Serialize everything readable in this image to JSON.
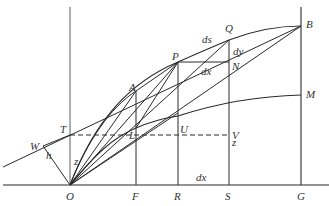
{
  "diagram": {
    "points": {
      "O": {
        "label": "O",
        "x": 70,
        "y": 185
      },
      "F": {
        "label": "F",
        "x": 136,
        "y": 185
      },
      "R": {
        "label": "R",
        "x": 178,
        "y": 185
      },
      "S": {
        "label": "S",
        "x": 229,
        "y": 185
      },
      "G": {
        "label": "G",
        "x": 301,
        "y": 185
      },
      "T": {
        "label": "T",
        "x": 70,
        "y": 135
      },
      "W": {
        "label": "W",
        "x": 43,
        "y": 146
      },
      "A": {
        "label": "A",
        "x": 136,
        "y": 91
      },
      "L": {
        "label": "L",
        "x": 136,
        "y": 128
      },
      "P": {
        "label": "P",
        "x": 178,
        "y": 62
      },
      "Q": {
        "label": "Q",
        "x": 229,
        "y": 40
      },
      "N": {
        "label": "N",
        "x": 229,
        "y": 62
      },
      "U": {
        "label": "U",
        "x": 178,
        "y": 135
      },
      "V": {
        "label": "V",
        "x": 229,
        "y": 135
      },
      "B": {
        "label": "B",
        "x": 301,
        "y": 26
      },
      "M": {
        "label": "M",
        "x": 301,
        "y": 95
      }
    },
    "annotations": {
      "ds": "ds",
      "dy": "dy",
      "dx_top": "dx",
      "dx_bottom": "dx",
      "z_left": "z",
      "z_right": "z",
      "h": "h"
    },
    "labels": {
      "O": "O",
      "F": "F",
      "R": "R",
      "S": "S",
      "G": "G",
      "T": "T",
      "W": "W",
      "A": "A",
      "L": "L",
      "P": "P",
      "Q": "Q",
      "N": "N",
      "U": "U",
      "V": "V",
      "B": "B",
      "M": "M"
    }
  }
}
